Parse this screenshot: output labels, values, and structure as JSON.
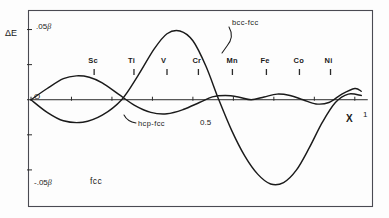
{
  "figure": {
    "type": "line-chart",
    "background": "#fdfdfd",
    "ink_color": "#1a1a1a"
  },
  "axes": {
    "y_label": "ΔE",
    "y_ticks": [
      {
        "label": ".05",
        "beta": "β",
        "value": 0.05
      },
      {
        "label": "",
        "beta": "",
        "value": 0.025
      },
      {
        "label": "O",
        "beta": "",
        "value": 0
      },
      {
        "label": "",
        "beta": "",
        "value": -0.025
      },
      {
        "label": "-.05",
        "beta": "β",
        "value": -0.05
      }
    ],
    "x_label": "X",
    "x_ticks": [
      {
        "label": "",
        "value": 0.0
      },
      {
        "label": "",
        "value": 0.125
      },
      {
        "label": "",
        "value": 0.25
      },
      {
        "label": "",
        "value": 0.375
      },
      {
        "label": "0.5",
        "value": 0.5
      },
      {
        "label": "",
        "value": 0.625
      },
      {
        "label": "",
        "value": 0.75
      },
      {
        "label": "",
        "value": 0.875
      },
      {
        "label": "1",
        "value": 1.0
      }
    ],
    "ylim": [
      -0.075,
      0.0625
    ],
    "xlim": [
      0,
      1.05
    ],
    "grid": false
  },
  "element_markers": [
    {
      "symbol": "Sc",
      "x": 0.195
    },
    {
      "symbol": "Ti",
      "x": 0.318
    },
    {
      "symbol": "V",
      "x": 0.42
    },
    {
      "symbol": "Cr",
      "x": 0.517
    },
    {
      "symbol": "Mn",
      "x": 0.622
    },
    {
      "symbol": "Fe",
      "x": 0.727
    },
    {
      "symbol": "Co",
      "x": 0.829
    },
    {
      "symbol": "Ni",
      "x": 0.925
    }
  ],
  "annotations": [
    {
      "name": "bcc-fcc-label",
      "text": "bcc-fcc"
    },
    {
      "name": "hcp-fcc-label",
      "text": "hcp-fcc"
    },
    {
      "name": "fcc-label",
      "text": "fcc"
    }
  ],
  "chart_data": {
    "type": "line",
    "title": "",
    "xlabel": "X",
    "ylabel": "ΔE",
    "xlim": [
      0,
      1.05
    ],
    "ylim": [
      -0.075,
      0.0625
    ],
    "grid": false,
    "series": [
      {
        "name": "bcc-fcc",
        "x": [
          0.0,
          0.05,
          0.1,
          0.16,
          0.22,
          0.28,
          0.33,
          0.38,
          0.42,
          0.46,
          0.5,
          0.54,
          0.58,
          0.62,
          0.66,
          0.7,
          0.74,
          0.78,
          0.82,
          0.86,
          0.9,
          0.94,
          0.98,
          1.02
        ],
        "y": [
          0.0,
          -0.009,
          -0.015,
          -0.016,
          -0.011,
          0.0,
          0.017,
          0.036,
          0.047,
          0.049,
          0.042,
          0.024,
          0.0,
          -0.022,
          -0.04,
          -0.053,
          -0.06,
          -0.059,
          -0.05,
          -0.034,
          -0.016,
          -0.002,
          0.004,
          0.003
        ]
      },
      {
        "name": "hcp-fcc",
        "x": [
          0.0,
          0.05,
          0.1,
          0.14,
          0.18,
          0.22,
          0.27,
          0.32,
          0.37,
          0.42,
          0.47,
          0.52,
          0.56,
          0.6,
          0.64,
          0.68,
          0.72,
          0.76,
          0.8,
          0.84,
          0.88,
          0.92,
          0.96,
          1.0,
          1.02
        ],
        "y": [
          0.0,
          0.008,
          0.015,
          0.017,
          0.016,
          0.012,
          0.004,
          -0.004,
          -0.009,
          -0.01,
          -0.007,
          -0.002,
          0.002,
          0.003,
          0.002,
          0.0,
          0.002,
          0.004,
          0.003,
          0.0,
          -0.003,
          -0.002,
          0.004,
          0.008,
          0.006
        ]
      }
    ]
  }
}
